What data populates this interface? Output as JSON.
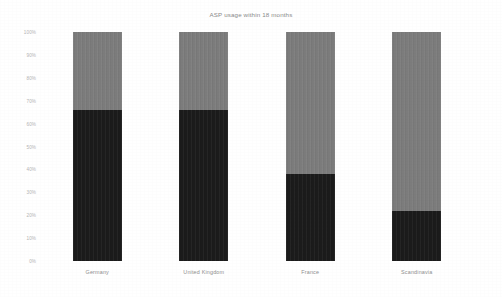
{
  "chart_data": {
    "type": "bar",
    "title": "ASP usage within 18 months",
    "subtitle": "",
    "xlabel": "",
    "ylabel": "",
    "stacked": true,
    "stack_normalized": true,
    "grid": false,
    "legend": "none",
    "ylim": [
      0,
      100
    ],
    "ytick_labels": [
      "100%",
      "90%",
      "80%",
      "70%",
      "60%",
      "50%",
      "40%",
      "30%",
      "20%",
      "10%",
      "0%"
    ],
    "ytick_values": [
      100,
      90,
      80,
      70,
      60,
      50,
      40,
      30,
      20,
      10,
      0
    ],
    "categories": [
      "Germany",
      "United Kingdom",
      "France",
      "Scandinavia"
    ],
    "series": [
      {
        "name": "lower-segment",
        "color": "#1b1b1b",
        "values": [
          66,
          66,
          38,
          22
        ]
      },
      {
        "name": "upper-segment",
        "color": "#7c7c7c",
        "values": [
          34,
          34,
          62,
          78
        ]
      }
    ]
  },
  "axis": {
    "y_ticks": [
      {
        "label": "100%",
        "value": 100
      },
      {
        "label": "90%",
        "value": 90
      },
      {
        "label": "80%",
        "value": 80
      },
      {
        "label": "70%",
        "value": 70
      },
      {
        "label": "60%",
        "value": 60
      },
      {
        "label": "50%",
        "value": 50
      },
      {
        "label": "40%",
        "value": 40
      },
      {
        "label": "30%",
        "value": 30
      },
      {
        "label": "20%",
        "value": 20
      },
      {
        "label": "10%",
        "value": 10
      },
      {
        "label": "0%",
        "value": 0
      }
    ]
  },
  "colors": {
    "background": "#ffffff",
    "segment_lower": "#1b1b1b",
    "segment_upper": "#7c7c7c",
    "title_text": "#8a8a8a",
    "tick_text": "#b4b4b4",
    "category_text": "#8e8e8e"
  }
}
